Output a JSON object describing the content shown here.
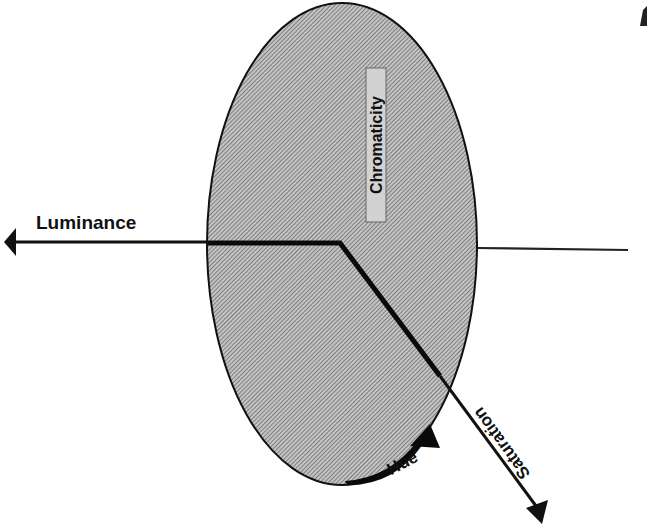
{
  "diagram": {
    "type": "color-space-ellipse",
    "labels": {
      "luminance": "Luminance",
      "chromaticity": "Chromaticity",
      "saturation": "Saturation",
      "hue": "Hue"
    },
    "colors": {
      "ink": "#111111",
      "hatch_fill": "#b8b8b8",
      "hatch_line": "#555555",
      "background": "#ffffff"
    }
  }
}
